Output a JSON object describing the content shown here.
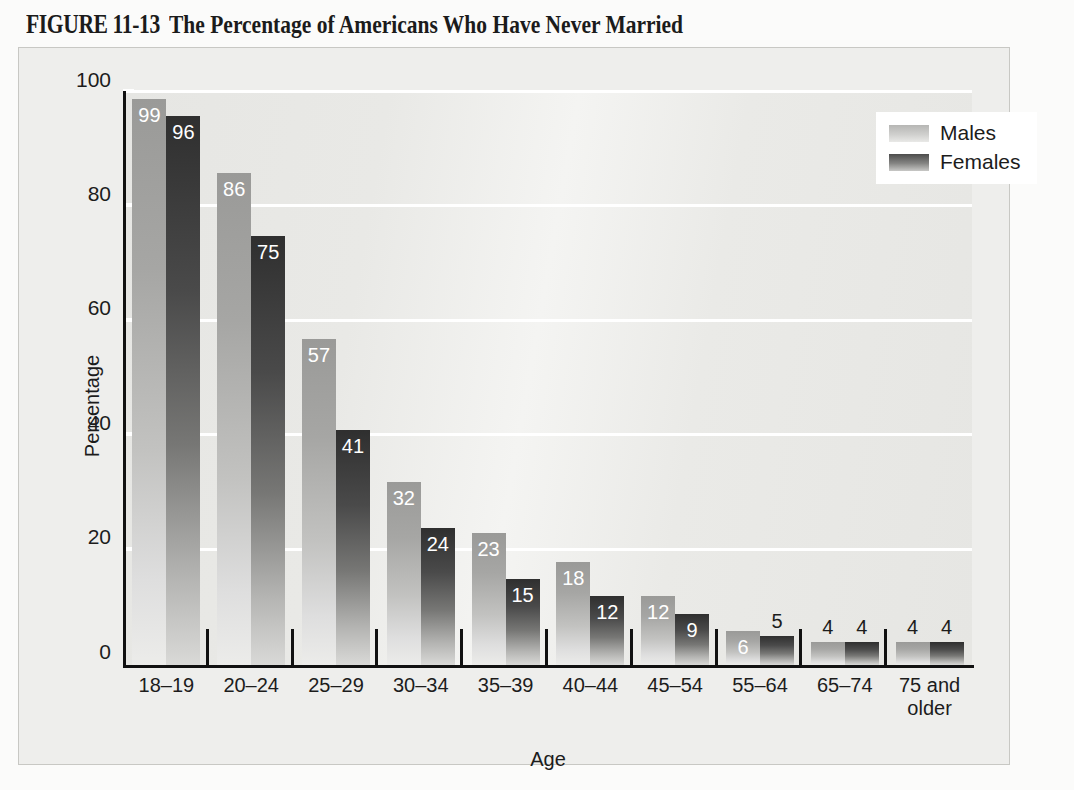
{
  "figure": {
    "label": "FIGURE 11-13",
    "title": "The Percentage of Americans Who Have Never Married"
  },
  "chart_data": {
    "type": "bar",
    "title": "The Percentage of Americans Who Have Never Married",
    "xlabel": "Age",
    "ylabel": "Percentage",
    "ylim": [
      0,
      100
    ],
    "yticks": [
      0,
      20,
      40,
      60,
      80,
      100
    ],
    "grid": true,
    "legend_position": "top-right",
    "categories": [
      "18–19",
      "20–24",
      "25–29",
      "30–34",
      "35–39",
      "40–44",
      "45–54",
      "55–64",
      "65–74",
      "75 and\nolder"
    ],
    "series": [
      {
        "name": "Males",
        "color": "#a8a8a6",
        "values": [
          99,
          86,
          57,
          32,
          23,
          18,
          12,
          6,
          4,
          4
        ]
      },
      {
        "name": "Females",
        "color": "#3d3d3d",
        "values": [
          96,
          75,
          41,
          24,
          15,
          12,
          9,
          5,
          4,
          4
        ]
      }
    ]
  },
  "legend": {
    "items": [
      {
        "label": "Males"
      },
      {
        "label": "Females"
      }
    ]
  }
}
